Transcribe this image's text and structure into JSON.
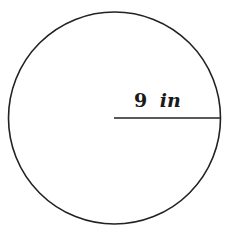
{
  "diagram": {
    "shape": "circle",
    "radius_value": "9",
    "radius_unit": "in",
    "stroke_color": "#222222",
    "background": "#ffffff"
  }
}
